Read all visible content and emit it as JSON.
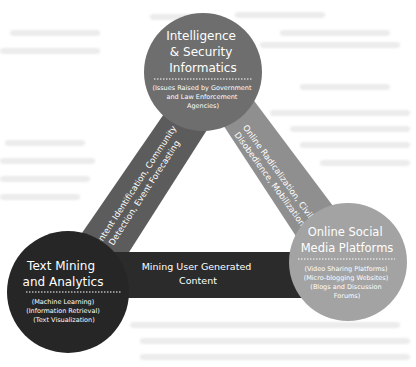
{
  "diagram": {
    "type": "triangle-of-circles",
    "nodes": [
      {
        "id": "intelligence",
        "title_lines": [
          "Intelligence",
          "& Security",
          "Informatics"
        ],
        "subtitle_lines": [
          "(Issues Raised by Government",
          "and Law Enforcement",
          "Agencies)"
        ],
        "color": "#6e6e6e"
      },
      {
        "id": "text-mining",
        "title_lines": [
          "Text Mining",
          "and Analytics"
        ],
        "subtitle_lines": [
          "(Machine Learning)",
          "(Information Retrieval)",
          "(Text Visualization)"
        ],
        "color": "#262626"
      },
      {
        "id": "social-media",
        "title_lines": [
          "Online Social",
          "Media Platforms"
        ],
        "subtitle_lines": [
          "(Video Sharing Platforms)",
          "(Micro-blogging Websites)",
          "(Blogs and Discussion",
          "Forums)"
        ],
        "color": "#a3a3a3"
      }
    ],
    "edges": [
      {
        "id": "left-edge",
        "from": "intelligence",
        "to": "text-mining",
        "label_lines": [
          "Content Identification, Community",
          "Detection, Event Forecasting"
        ],
        "color": "#5c5c5c"
      },
      {
        "id": "right-edge",
        "from": "intelligence",
        "to": "social-media",
        "label_lines": [
          "Online Radicalization, Civil",
          "Disobedience, Mobilization"
        ],
        "color": "#8f8f8f"
      },
      {
        "id": "bottom-edge",
        "from": "text-mining",
        "to": "social-media",
        "label_lines": [
          "Mining User Generated",
          "Content"
        ],
        "color": "#2b2b2b"
      }
    ]
  }
}
